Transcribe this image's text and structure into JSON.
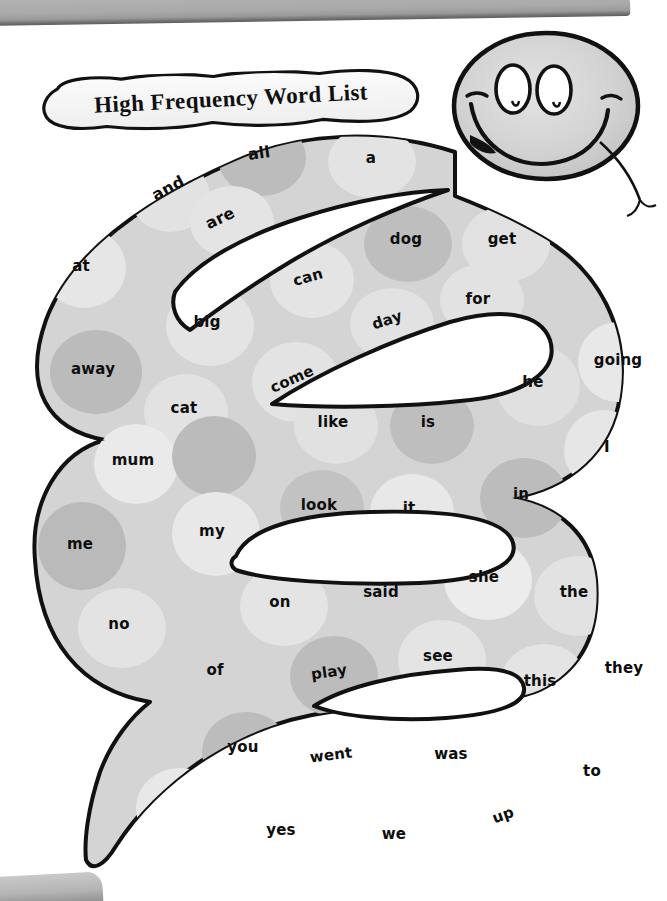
{
  "page": {
    "title": "High Frequency Word List",
    "background_color": "#ffffff"
  },
  "decor": {
    "top_bar_name": "scanner-top-edge",
    "bottom_tab_name": "scanner-bottom-tab",
    "top_bar_color": "#a9a9a9",
    "bottom_tab_color": "#b4b4b4"
  },
  "snake": {
    "body_color": "#d4d4d4",
    "spot_dark_color": "#bdbdbd",
    "spot_light_color": "#e6e6e6",
    "outline_color": "#111111",
    "head_color": "#d0d0d0",
    "eye_color": "#ffffff",
    "tongue_color": "#111111"
  },
  "words": [
    {
      "text": "a",
      "x": 371,
      "y": 158,
      "rot": 0,
      "size": 15
    },
    {
      "text": "all",
      "x": 259,
      "y": 153,
      "rot": -8,
      "size": 16
    },
    {
      "text": "and",
      "x": 168,
      "y": 188,
      "rot": -28,
      "size": 16
    },
    {
      "text": "are",
      "x": 220,
      "y": 218,
      "rot": -26,
      "size": 16
    },
    {
      "text": "at",
      "x": 81,
      "y": 266,
      "rot": 0,
      "size": 15
    },
    {
      "text": "away",
      "x": 93,
      "y": 369,
      "rot": 0,
      "size": 15
    },
    {
      "text": "big",
      "x": 207,
      "y": 322,
      "rot": 0,
      "size": 15
    },
    {
      "text": "can",
      "x": 308,
      "y": 277,
      "rot": -16,
      "size": 15
    },
    {
      "text": "cat",
      "x": 184,
      "y": 408,
      "rot": 0,
      "size": 15
    },
    {
      "text": "come",
      "x": 292,
      "y": 379,
      "rot": -24,
      "size": 15
    },
    {
      "text": "day",
      "x": 387,
      "y": 320,
      "rot": -18,
      "size": 15
    },
    {
      "text": "dog",
      "x": 406,
      "y": 239,
      "rot": 0,
      "size": 15
    },
    {
      "text": "for",
      "x": 478,
      "y": 299,
      "rot": 0,
      "size": 15
    },
    {
      "text": "get",
      "x": 502,
      "y": 239,
      "rot": 0,
      "size": 15
    },
    {
      "text": "going",
      "x": 618,
      "y": 360,
      "rot": 0,
      "size": 15
    },
    {
      "text": "he",
      "x": 533,
      "y": 382,
      "rot": 0,
      "size": 15
    },
    {
      "text": "I",
      "x": 607,
      "y": 447,
      "rot": 0,
      "size": 15
    },
    {
      "text": "in",
      "x": 521,
      "y": 494,
      "rot": 0,
      "size": 15
    },
    {
      "text": "is",
      "x": 428,
      "y": 422,
      "rot": 0,
      "size": 15
    },
    {
      "text": "it",
      "x": 409,
      "y": 508,
      "rot": 0,
      "size": 15
    },
    {
      "text": "like",
      "x": 333,
      "y": 422,
      "rot": 0,
      "size": 15
    },
    {
      "text": "look",
      "x": 319,
      "y": 505,
      "rot": 0,
      "size": 15
    },
    {
      "text": "me",
      "x": 80,
      "y": 544,
      "rot": 0,
      "size": 15
    },
    {
      "text": "mum",
      "x": 133,
      "y": 460,
      "rot": 0,
      "size": 15
    },
    {
      "text": "my",
      "x": 212,
      "y": 531,
      "rot": 0,
      "size": 15
    },
    {
      "text": "no",
      "x": 119,
      "y": 624,
      "rot": 0,
      "size": 15
    },
    {
      "text": "of",
      "x": 215,
      "y": 670,
      "rot": 0,
      "size": 15
    },
    {
      "text": "on",
      "x": 280,
      "y": 602,
      "rot": 0,
      "size": 15
    },
    {
      "text": "play",
      "x": 329,
      "y": 672,
      "rot": -8,
      "size": 15
    },
    {
      "text": "said",
      "x": 381,
      "y": 592,
      "rot": 0,
      "size": 15
    },
    {
      "text": "see",
      "x": 438,
      "y": 656,
      "rot": 0,
      "size": 15
    },
    {
      "text": "she",
      "x": 484,
      "y": 577,
      "rot": 0,
      "size": 15
    },
    {
      "text": "the",
      "x": 574,
      "y": 592,
      "rot": 0,
      "size": 15
    },
    {
      "text": "they",
      "x": 624,
      "y": 668,
      "rot": 0,
      "size": 15
    },
    {
      "text": "this",
      "x": 540,
      "y": 681,
      "rot": 0,
      "size": 15
    },
    {
      "text": "to",
      "x": 592,
      "y": 771,
      "rot": 0,
      "size": 15
    },
    {
      "text": "up",
      "x": 503,
      "y": 815,
      "rot": -20,
      "size": 15
    },
    {
      "text": "was",
      "x": 451,
      "y": 754,
      "rot": 0,
      "size": 15
    },
    {
      "text": "we",
      "x": 394,
      "y": 834,
      "rot": 0,
      "size": 15
    },
    {
      "text": "went",
      "x": 331,
      "y": 755,
      "rot": -7,
      "size": 15
    },
    {
      "text": "yes",
      "x": 281,
      "y": 830,
      "rot": 0,
      "size": 15
    },
    {
      "text": "you",
      "x": 243,
      "y": 747,
      "rot": 0,
      "size": 15
    }
  ]
}
